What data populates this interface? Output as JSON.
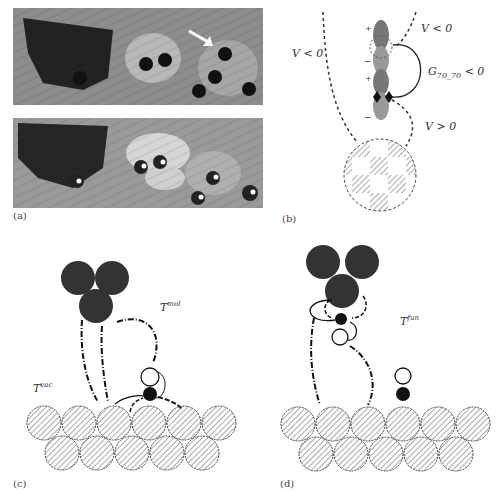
{
  "figure": {
    "panels": [
      {
        "id": "a",
        "label": "(a)",
        "description": "Two STM images: top with dark molecules and white arrow, bottom with bright-centered molecules"
      },
      {
        "id": "b",
        "label": "(b)",
        "annotations": [
          "V < 0",
          "V < 0",
          "G70_70 < 0",
          "V > 0"
        ],
        "charge_signs": [
          "+",
          "−",
          "+",
          "−"
        ]
      },
      {
        "id": "c",
        "label": "(c)",
        "annotations": [
          "T mol",
          "T vac"
        ]
      },
      {
        "id": "d",
        "label": "(d)",
        "annotations": [
          "T fun"
        ]
      }
    ]
  },
  "panel_a": {
    "label": "(a)"
  },
  "panel_b": {
    "label": "(b)",
    "v_left": "V < 0",
    "v_right_top": "V < 0",
    "g_label": "G",
    "g_sub": "70_70",
    "g_rel": " < 0",
    "v_bottom": "V > 0",
    "plus1": "+",
    "minus1": "−",
    "plus2": "+",
    "minus2": "−"
  },
  "panel_c": {
    "label": "(c)",
    "t_main": "T",
    "t_mol_sup": "mol",
    "t_vac_sup": "vac"
  },
  "panel_d": {
    "label": "(d)",
    "t_main": "T",
    "t_fun_sup": "fun"
  }
}
